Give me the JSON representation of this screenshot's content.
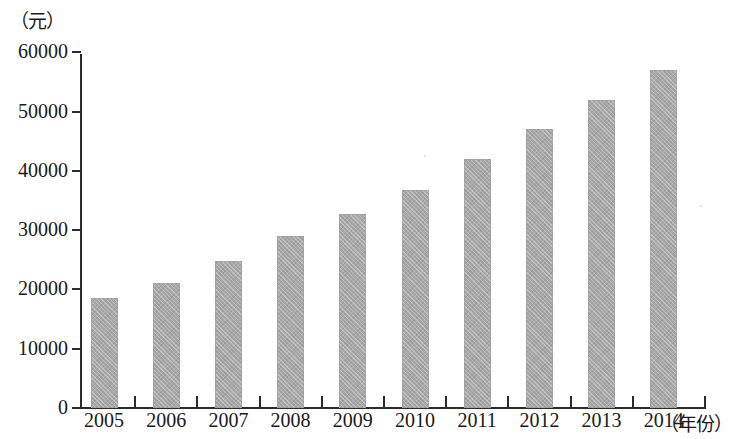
{
  "chart_data": {
    "type": "bar",
    "title": "",
    "xlabel": "（年份）",
    "ylabel": "（元）",
    "categories": [
      "2005",
      "2006",
      "2007",
      "2008",
      "2009",
      "2010",
      "2011",
      "2012",
      "2013",
      "2014"
    ],
    "values": [
      18500,
      21000,
      24800,
      29000,
      32700,
      36800,
      42000,
      47000,
      52000,
      57000
    ],
    "ylim": [
      0,
      60000
    ],
    "yticks": [
      0,
      10000,
      20000,
      30000,
      40000,
      50000,
      60000
    ],
    "ytick_labels": [
      "0",
      "10000",
      "20000",
      "30000",
      "40000",
      "50000",
      "60000"
    ],
    "grid": false,
    "legend": null,
    "series": [
      {
        "name": "",
        "values": [
          18500,
          21000,
          24800,
          29000,
          32700,
          36800,
          42000,
          47000,
          52000,
          57000
        ]
      }
    ],
    "bar_color": "#a8a8a8",
    "axis_color": "#2b2b2b"
  },
  "axes": {
    "y_unit_label": "（元）",
    "x_unit_label": "（年份）"
  }
}
